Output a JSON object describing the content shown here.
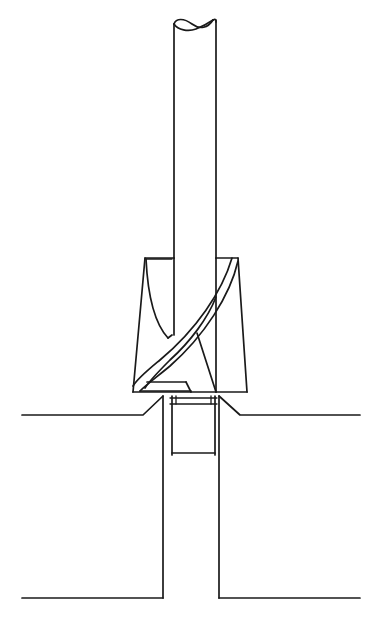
{
  "figure": {
    "type": "technical-line-drawing",
    "background_color": "#ffffff",
    "line_color": "#1a1a1a",
    "width": 381,
    "height": 620
  },
  "parts": {
    "shank": {
      "name": "Cylindrical shank",
      "left_x": 174,
      "right_x": 216,
      "top_y": 18,
      "bottom_y": 258,
      "break_line": "s-curve"
    },
    "countersink_cone": {
      "name": "Countersink cone with helical flutes",
      "top_y": 258,
      "bottom_y": 392,
      "top_left_x": 145,
      "top_right_x": 238,
      "bottom_left_x": 133,
      "bottom_right_x": 247,
      "flute_count": 2
    },
    "pilot_drill": {
      "name": "Pilot drill body in hole",
      "left_x": 172,
      "right_x": 215,
      "top_y": 396,
      "bottom_y": 455
    },
    "workpiece": {
      "name": "Workpiece cross-section",
      "top_surface_y": 415,
      "bottom_surface_y": 598,
      "left_edge_x": 22,
      "right_edge_x": 360,
      "hole_left_x": 163,
      "hole_right_x": 219,
      "chamfer_left_outer_x": 143,
      "chamfer_right_outer_x": 240
    }
  },
  "labels": {
    "figure_caption": "",
    "shank_label": "",
    "flute_label": "",
    "workpiece_label": ""
  },
  "colors": {
    "stroke": "#1a1a1a",
    "background": "#ffffff",
    "fill": "#ffffff"
  }
}
